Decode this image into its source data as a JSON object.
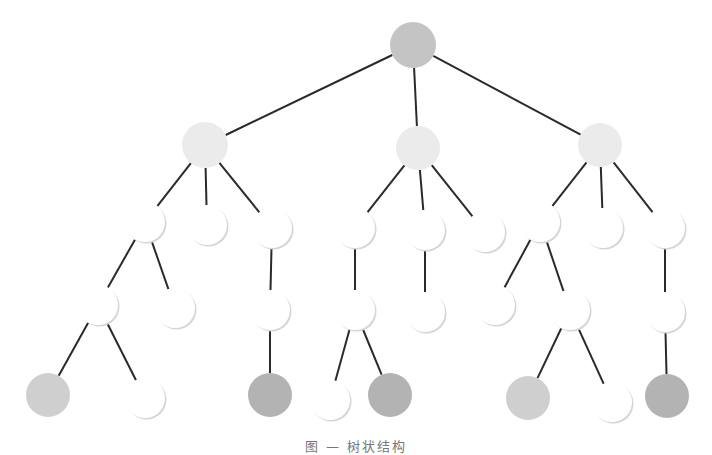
{
  "diagram": {
    "type": "tree",
    "caption": "图 — 树状结构",
    "colors": {
      "edge": "#2a2a2a",
      "root": "#c4c4c4",
      "level1": "#ebebeb",
      "white": "#ffffff",
      "leaf_gray": "#cfcfcf",
      "leaf_dark": "#b3b3b3",
      "shadow": "#d6d6d6"
    },
    "nodes": [
      {
        "id": "n0",
        "x": 413,
        "y": 45,
        "r": 23,
        "fill": "root"
      },
      {
        "id": "n1",
        "x": 205,
        "y": 145,
        "r": 23,
        "fill": "level1"
      },
      {
        "id": "n2",
        "x": 418,
        "y": 148,
        "r": 22,
        "fill": "level1"
      },
      {
        "id": "n3",
        "x": 600,
        "y": 145,
        "r": 22,
        "fill": "level1"
      },
      {
        "id": "n4",
        "x": 145,
        "y": 222,
        "r": 20,
        "fill": "white"
      },
      {
        "id": "n5",
        "x": 207,
        "y": 225,
        "r": 20,
        "fill": "white"
      },
      {
        "id": "n6",
        "x": 272,
        "y": 228,
        "r": 20,
        "fill": "white"
      },
      {
        "id": "n7",
        "x": 355,
        "y": 228,
        "r": 20,
        "fill": "white"
      },
      {
        "id": "n8",
        "x": 425,
        "y": 230,
        "r": 20,
        "fill": "white"
      },
      {
        "id": "n9",
        "x": 485,
        "y": 232,
        "r": 20,
        "fill": "white"
      },
      {
        "id": "n10",
        "x": 540,
        "y": 222,
        "r": 20,
        "fill": "white"
      },
      {
        "id": "n11",
        "x": 603,
        "y": 228,
        "r": 20,
        "fill": "white"
      },
      {
        "id": "n12",
        "x": 665,
        "y": 228,
        "r": 20,
        "fill": "white"
      },
      {
        "id": "n13",
        "x": 98,
        "y": 305,
        "r": 20,
        "fill": "white"
      },
      {
        "id": "n14",
        "x": 175,
        "y": 308,
        "r": 20,
        "fill": "white"
      },
      {
        "id": "n15",
        "x": 270,
        "y": 310,
        "r": 20,
        "fill": "white"
      },
      {
        "id": "n16",
        "x": 355,
        "y": 310,
        "r": 20,
        "fill": "white"
      },
      {
        "id": "n17",
        "x": 425,
        "y": 312,
        "r": 20,
        "fill": "white"
      },
      {
        "id": "n18",
        "x": 495,
        "y": 305,
        "r": 20,
        "fill": "white"
      },
      {
        "id": "n19",
        "x": 570,
        "y": 310,
        "r": 20,
        "fill": "white"
      },
      {
        "id": "n20",
        "x": 665,
        "y": 312,
        "r": 20,
        "fill": "white"
      },
      {
        "id": "n21",
        "x": 48,
        "y": 395,
        "r": 22,
        "fill": "leaf_gray"
      },
      {
        "id": "n22",
        "x": 145,
        "y": 398,
        "r": 20,
        "fill": "white"
      },
      {
        "id": "n23",
        "x": 270,
        "y": 395,
        "r": 22,
        "fill": "leaf_dark"
      },
      {
        "id": "n24",
        "x": 330,
        "y": 400,
        "r": 20,
        "fill": "white"
      },
      {
        "id": "n25",
        "x": 390,
        "y": 395,
        "r": 22,
        "fill": "leaf_dark"
      },
      {
        "id": "n26",
        "x": 528,
        "y": 398,
        "r": 22,
        "fill": "leaf_gray"
      },
      {
        "id": "n27",
        "x": 612,
        "y": 402,
        "r": 20,
        "fill": "white"
      },
      {
        "id": "n28",
        "x": 667,
        "y": 396,
        "r": 22,
        "fill": "leaf_dark"
      }
    ],
    "edges": [
      [
        "n0",
        "n1"
      ],
      [
        "n0",
        "n2"
      ],
      [
        "n0",
        "n3"
      ],
      [
        "n1",
        "n4"
      ],
      [
        "n1",
        "n5"
      ],
      [
        "n1",
        "n6"
      ],
      [
        "n2",
        "n7"
      ],
      [
        "n2",
        "n8"
      ],
      [
        "n2",
        "n9"
      ],
      [
        "n3",
        "n10"
      ],
      [
        "n3",
        "n11"
      ],
      [
        "n3",
        "n12"
      ],
      [
        "n4",
        "n13"
      ],
      [
        "n4",
        "n14"
      ],
      [
        "n6",
        "n15"
      ],
      [
        "n7",
        "n16"
      ],
      [
        "n8",
        "n17"
      ],
      [
        "n10",
        "n18"
      ],
      [
        "n10",
        "n19"
      ],
      [
        "n12",
        "n20"
      ],
      [
        "n13",
        "n21"
      ],
      [
        "n13",
        "n22"
      ],
      [
        "n15",
        "n23"
      ],
      [
        "n16",
        "n24"
      ],
      [
        "n16",
        "n25"
      ],
      [
        "n19",
        "n26"
      ],
      [
        "n19",
        "n27"
      ],
      [
        "n20",
        "n28"
      ]
    ]
  }
}
